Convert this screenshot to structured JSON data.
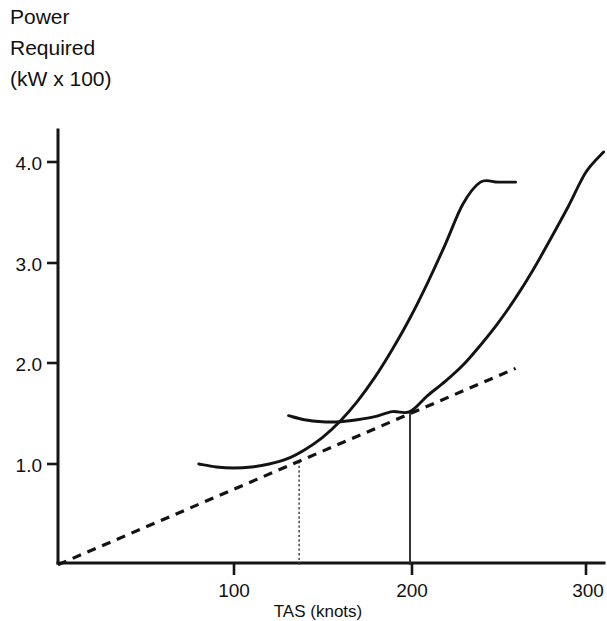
{
  "chart_data": {
    "type": "line",
    "title": "Power Required (kW x 100)",
    "title_lines": [
      "Power",
      "Required",
      "(kW x 100)"
    ],
    "xlabel": "TAS (knots)",
    "ylabel": "Power Required (kW x 100)",
    "xlim": [
      0,
      312
    ],
    "ylim": [
      0,
      4.35
    ],
    "grid": false,
    "legend": "none",
    "x_ticks": [
      100,
      200,
      300
    ],
    "x_tick_labels": [
      "100",
      "200",
      "300"
    ],
    "y_ticks": [
      1.0,
      2.0,
      3.0,
      4.0
    ],
    "y_tick_labels": [
      "1.0",
      "2.0",
      "3.0",
      "4.0"
    ],
    "series": [
      {
        "name": "power-required-curve-low-altitude",
        "style": "solid",
        "x": [
          80,
          90,
          100,
          110,
          120,
          130,
          140,
          150,
          160,
          170,
          180,
          190,
          200,
          210,
          220,
          230,
          240,
          250,
          260
        ],
        "y": [
          1.0,
          0.97,
          0.96,
          0.97,
          1.0,
          1.05,
          1.14,
          1.26,
          1.42,
          1.62,
          1.86,
          2.14,
          2.45,
          2.8,
          3.18,
          3.58,
          3.8,
          3.8,
          3.8
        ]
      },
      {
        "name": "power-required-curve-high-altitude",
        "style": "solid",
        "x": [
          131,
          140,
          150,
          160,
          170,
          180,
          190,
          200,
          210,
          220,
          230,
          240,
          250,
          260,
          270,
          280,
          290,
          300,
          310
        ],
        "y": [
          1.48,
          1.44,
          1.42,
          1.42,
          1.44,
          1.47,
          1.52,
          1.52,
          1.68,
          1.82,
          1.98,
          2.18,
          2.4,
          2.65,
          2.93,
          3.24,
          3.56,
          3.9,
          4.1
        ]
      },
      {
        "name": "tangent-line-from-origin",
        "style": "dashed",
        "x": [
          0,
          260
        ],
        "y": [
          0.0,
          1.95
        ]
      }
    ],
    "annotations": [
      {
        "name": "dropline-max-range-low-altitude",
        "type": "vertical-dropline",
        "style": "dotted",
        "x": 137,
        "y_from": 0.0,
        "y_to": 1.03
      },
      {
        "name": "dropline-max-range-high-altitude",
        "type": "vertical-dropline",
        "style": "solid",
        "x": 200,
        "y_from": 0.0,
        "y_to": 1.52
      }
    ]
  }
}
